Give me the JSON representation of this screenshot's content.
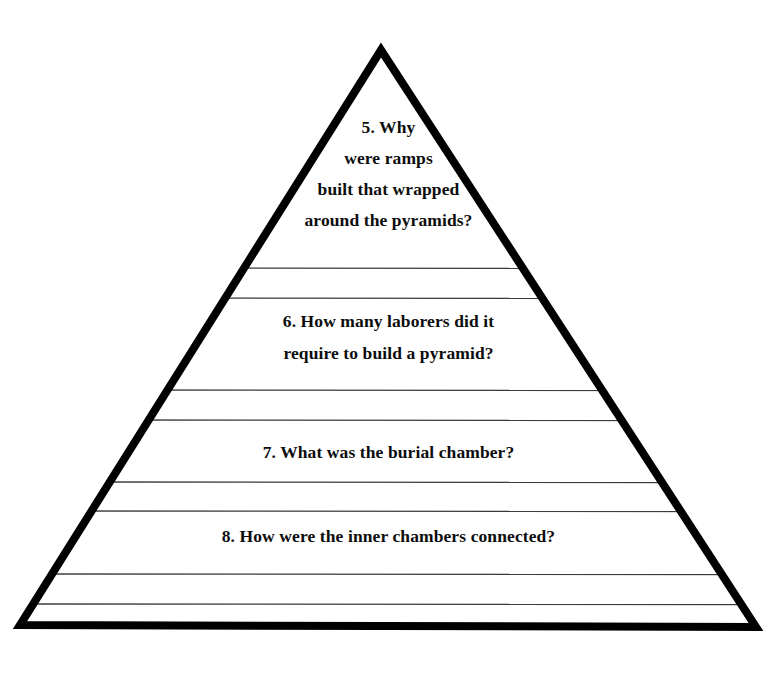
{
  "document": {
    "type": "pyramid-diagram-worksheet",
    "background_color": "#ffffff",
    "ink_color": "#000000"
  },
  "pyramid": {
    "apex": {
      "x": 381,
      "y": 50
    },
    "bottom_left": {
      "x": 20,
      "y": 625
    },
    "bottom_right": {
      "x": 756,
      "y": 627
    },
    "outline_stroke_width": 8,
    "rule_stroke_width": 1.4,
    "rule_color": "#3a3a3a",
    "rules_y": [
      268,
      298,
      390,
      420,
      482,
      511,
      574,
      604
    ]
  },
  "questions": [
    {
      "number": "5.",
      "lines": [
        "5.  Why",
        "were ramps",
        "built that wrapped",
        "around the pyramids?"
      ]
    },
    {
      "number": "6.",
      "lines": [
        "6.  How many laborers did it",
        "require to build a pyramid?"
      ]
    },
    {
      "number": "7.",
      "lines": [
        "7.  What was the burial chamber?"
      ]
    },
    {
      "number": "8.",
      "lines": [
        "8.  How were the inner chambers connected?"
      ]
    }
  ]
}
